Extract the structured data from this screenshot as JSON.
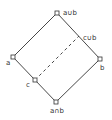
{
  "diagram": {
    "type": "lattice (Hasse diagram)",
    "nodes": [
      {
        "id": "top",
        "label": "a∪b",
        "x": 57,
        "y": 13
      },
      {
        "id": "a",
        "label": "a",
        "x": 13,
        "y": 57
      },
      {
        "id": "b",
        "label": "b",
        "x": 100,
        "y": 59
      },
      {
        "id": "c",
        "label": "c",
        "x": 35,
        "y": 80
      },
      {
        "id": "bottom",
        "label": "a∩b",
        "x": 56,
        "y": 102
      },
      {
        "id": "cub",
        "label": "c∪b",
        "x": 79,
        "y": 36
      }
    ],
    "edges": [
      {
        "from": "top",
        "to": "a",
        "style": "solid"
      },
      {
        "from": "top",
        "to": "b",
        "style": "solid"
      },
      {
        "from": "a",
        "to": "bottom",
        "style": "solid"
      },
      {
        "from": "b",
        "to": "bottom",
        "style": "solid"
      },
      {
        "from": "c",
        "to": "cub",
        "style": "dashed"
      }
    ]
  },
  "labels": {
    "top": "a∪b",
    "a": "a",
    "b": "b",
    "c": "c",
    "cub": "c∪b",
    "bottom": "a∩b"
  },
  "colors": {
    "line": "#333333",
    "node_fill": "#ffffff"
  }
}
